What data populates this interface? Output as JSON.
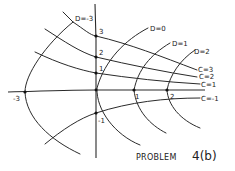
{
  "diagram": {
    "title": "PROBLEM",
    "title_suffix": "4(b)",
    "d_curves": [
      {
        "label": "D=-3"
      },
      {
        "label": "D=0"
      },
      {
        "label": "D=1"
      },
      {
        "label": "D=2"
      }
    ],
    "c_curves": [
      {
        "label": "C=3"
      },
      {
        "label": "C=2"
      },
      {
        "label": "C=1"
      },
      {
        "label": "C=-1"
      }
    ],
    "axis_points": {
      "y_3": "3",
      "y_2": "2",
      "y_1": "1",
      "y_neg1": "-1",
      "x_neg3": "-3",
      "x_1": "1",
      "x_2": "2"
    },
    "colors": {
      "ink": "#2a2a2a",
      "background": "#ffffff"
    }
  }
}
